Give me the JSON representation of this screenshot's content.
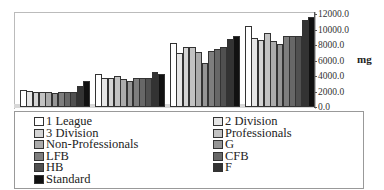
{
  "chart_data": {
    "type": "bar",
    "title": "",
    "xlabel": "",
    "ylabel": "mg",
    "ylim": [
      0,
      12000
    ],
    "yticks": [
      "12000.0",
      "10000.0",
      "8000.0",
      "6000.0",
      "4000.0",
      "2000.0",
      "0.0"
    ],
    "categories": [
      "Group 1",
      "Group 2",
      "Group 3",
      "Group 4"
    ],
    "grid": false,
    "legend_position": "bottom",
    "series": [
      {
        "name": "1 League",
        "color": "#ffffff",
        "values": [
          2200,
          4300,
          8300,
          10400
        ]
      },
      {
        "name": "2 Division",
        "color": "#e6e6e6",
        "values": [
          2100,
          3800,
          7000,
          8900
        ]
      },
      {
        "name": "3 Division",
        "color": "#d4d4d4",
        "values": [
          1900,
          3700,
          7700,
          8700
        ]
      },
      {
        "name": "Professionals",
        "color": "#c2c2c2",
        "values": [
          2000,
          4000,
          7700,
          9600
        ]
      },
      {
        "name": "Non-Professionals",
        "color": "#ababab",
        "values": [
          2000,
          3600,
          7100,
          8500
        ]
      },
      {
        "name": "G",
        "color": "#959595",
        "values": [
          1800,
          3300,
          5700,
          8100
        ]
      },
      {
        "name": "LFB",
        "color": "#7e7e7e",
        "values": [
          1900,
          3800,
          7200,
          9200
        ]
      },
      {
        "name": "CFB",
        "color": "#676767",
        "values": [
          2000,
          3800,
          7500,
          9100
        ]
      },
      {
        "name": "HB",
        "color": "#505050",
        "values": [
          1900,
          3800,
          7700,
          9100
        ]
      },
      {
        "name": "F",
        "color": "#333333",
        "values": [
          2700,
          4500,
          8800,
          11200
        ]
      },
      {
        "name": "Standard",
        "color": "#111111",
        "values": [
          3300,
          4200,
          9100,
          11600
        ]
      }
    ]
  },
  "legend": {
    "left": [
      "1 League",
      "3 Division",
      "Non-Professionals",
      "LFB",
      "HB",
      "Standard"
    ],
    "right": [
      "2 Division",
      "Professionals",
      "G",
      "CFB",
      "F"
    ]
  }
}
